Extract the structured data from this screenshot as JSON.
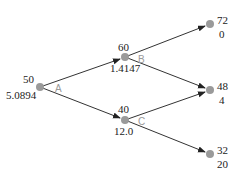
{
  "diagram": {
    "type": "binomial-tree",
    "colors": {
      "edge": "#333333",
      "node": "#9a9a9a",
      "edge_label": "#9a9a9a",
      "text": "#222222"
    },
    "nodes": [
      {
        "id": "root",
        "x": 40,
        "y": 87,
        "top": "50",
        "bottom": "5.0894"
      },
      {
        "id": "up",
        "x": 125,
        "y": 57,
        "top": "60",
        "bottom": "1.4147"
      },
      {
        "id": "down",
        "x": 125,
        "y": 120,
        "top": "40",
        "bottom": "12.0"
      },
      {
        "id": "uu",
        "x": 210,
        "y": 24,
        "top": "72",
        "bottom": "0"
      },
      {
        "id": "ud",
        "x": 210,
        "y": 90,
        "top": "48",
        "bottom": "4"
      },
      {
        "id": "dd",
        "x": 210,
        "y": 154,
        "top": "32",
        "bottom": "20"
      }
    ],
    "edge_labels": {
      "A": "A",
      "B": "B",
      "C": "C"
    }
  }
}
